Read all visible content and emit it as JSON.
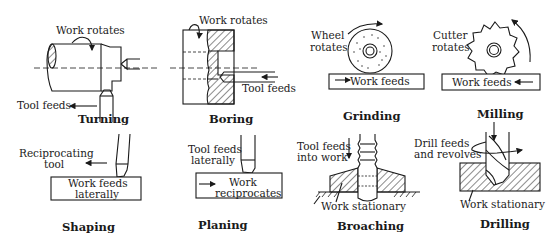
{
  "figure": {
    "panels": [
      {
        "id": "turning",
        "title": "Turning",
        "labels": {
          "work": "Work rotates",
          "tool": "Tool feeds"
        }
      },
      {
        "id": "boring",
        "title": "Boring",
        "labels": {
          "work": "Work rotates",
          "tool": "Tool feeds"
        }
      },
      {
        "id": "grinding",
        "title": "Grinding",
        "labels": {
          "wheel_1": "Wheel",
          "wheel_2": "rotates",
          "work": "Work feeds"
        }
      },
      {
        "id": "milling",
        "title": "Milling",
        "labels": {
          "cutter_1": "Cutter",
          "cutter_2": "rotates",
          "work": "Work feeds"
        }
      },
      {
        "id": "shaping",
        "title": "Shaping",
        "labels": {
          "tool_1": "Reciprocating",
          "tool_2": "tool",
          "work_1": "Work feeds",
          "work_2": "laterally"
        }
      },
      {
        "id": "planing",
        "title": "Planing",
        "labels": {
          "tool_1": "Tool feeds",
          "tool_2": "laterally",
          "work_1": "Work",
          "work_2": "reciprocates"
        }
      },
      {
        "id": "broaching",
        "title": "Broaching",
        "labels": {
          "tool_1": "Tool feeds",
          "tool_2": "into work",
          "work": "Work stationary"
        }
      },
      {
        "id": "drilling",
        "title": "Drilling",
        "labels": {
          "drill_1": "Drill feeds",
          "drill_2": "and revolves",
          "work": "Work stationary"
        }
      }
    ]
  },
  "colors": {
    "ink": "#1a1a1a",
    "background": "#ffffff"
  }
}
